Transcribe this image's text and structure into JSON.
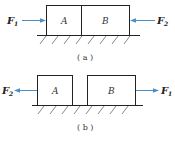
{
  "colors": {
    "arrow": "#4a90c8",
    "line": "#222222",
    "background": "#ffffff"
  },
  "figure_a": {
    "caption": "( a )",
    "blocks": [
      {
        "name": "A",
        "label": "A"
      },
      {
        "name": "B",
        "label": "B"
      }
    ],
    "forces": [
      {
        "name": "F",
        "sub": "1",
        "direction": "right",
        "side": "left"
      },
      {
        "name": "F",
        "sub": "2",
        "direction": "left",
        "side": "right"
      }
    ],
    "blocks_touching": true
  },
  "figure_b": {
    "caption": "( b )",
    "blocks": [
      {
        "name": "A",
        "label": "A"
      },
      {
        "name": "B",
        "label": "B"
      }
    ],
    "forces": [
      {
        "name": "F",
        "sub": "2",
        "direction": "left",
        "side": "left"
      },
      {
        "name": "F",
        "sub": "1",
        "direction": "right",
        "side": "right"
      }
    ],
    "blocks_touching": false
  }
}
